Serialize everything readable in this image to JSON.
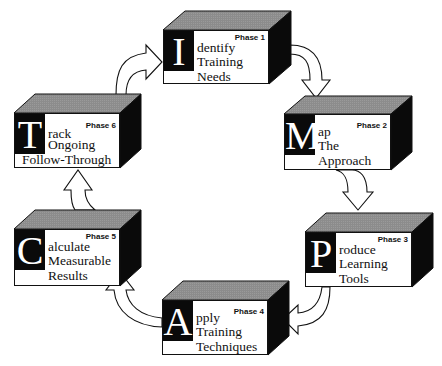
{
  "diagram": {
    "type": "cycle",
    "acronym": "IMPACT",
    "colors": {
      "box_top": "#8c8c8c",
      "box_side": "#0a0a0a",
      "box_front": "#ffffff",
      "letter_bg": "#0a0a0a",
      "letter_fg": "#ffffff",
      "arrow_fill": "#ffffff",
      "arrow_stroke": "#111111"
    },
    "phases": [
      {
        "id": 1,
        "phase_label": "Phase 1",
        "letter": "I",
        "first_line_rest": "dentify",
        "line2": "Training",
        "line3": "Needs",
        "full_title": "Identify Training Needs"
      },
      {
        "id": 2,
        "phase_label": "Phase 2",
        "letter": "M",
        "first_line_rest": "ap",
        "line2": "The",
        "line3": "Approach",
        "full_title": "Map The Approach"
      },
      {
        "id": 3,
        "phase_label": "Phase 3",
        "letter": "P",
        "first_line_rest": "roduce",
        "line2": "Learning",
        "line3": "Tools",
        "full_title": "Produce Learning Tools"
      },
      {
        "id": 4,
        "phase_label": "Phase 4",
        "letter": "A",
        "first_line_rest": "pply",
        "line2": "Training",
        "line3": "Techniques",
        "full_title": "Apply Training Techniques"
      },
      {
        "id": 5,
        "phase_label": "Phase 5",
        "letter": "C",
        "first_line_rest": "alculate",
        "line2": "Measurable",
        "line3": "Results",
        "full_title": "Calculate Measurable Results"
      },
      {
        "id": 6,
        "phase_label": "Phase 6",
        "letter": "T",
        "first_line_rest": "rack",
        "line2": "Ongoing",
        "line3": "Follow-Through",
        "full_title": "Track Ongoing Follow-Through"
      }
    ],
    "connections": [
      {
        "from": 1,
        "to": 2
      },
      {
        "from": 2,
        "to": 3
      },
      {
        "from": 3,
        "to": 4
      },
      {
        "from": 4,
        "to": 5
      },
      {
        "from": 5,
        "to": 6
      },
      {
        "from": 6,
        "to": 1
      }
    ]
  }
}
